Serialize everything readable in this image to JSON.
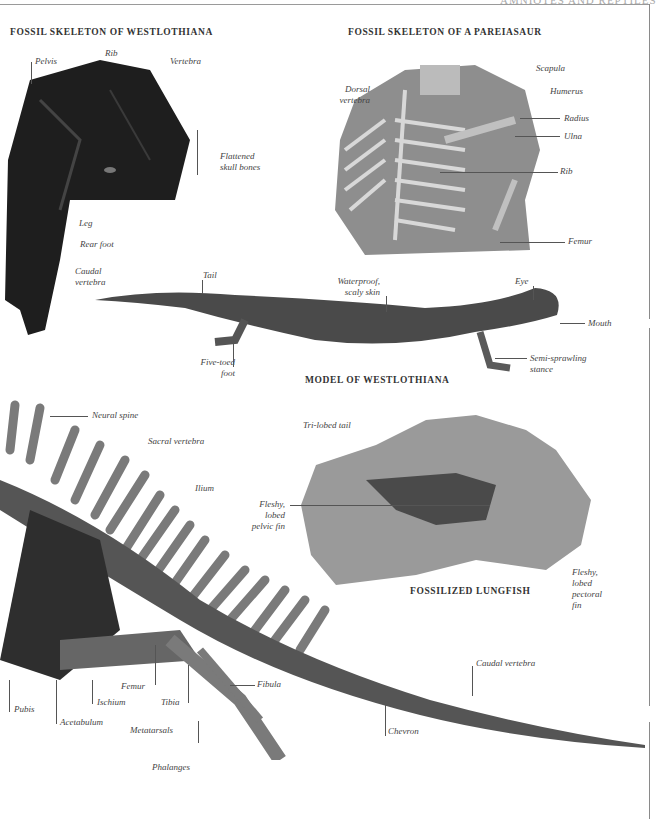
{
  "page": {
    "running_head": "AMNIOTES AND REPTILES"
  },
  "sections": {
    "westlothiana_fossil": {
      "title": "FOSSIL SKELETON OF WESTLOTHIANA",
      "labels": [
        "Pelvis",
        "Rib",
        "Vertebra",
        "Flattened",
        "skull bones",
        "Leg",
        "Rear foot",
        "Caudal",
        "vertebra"
      ]
    },
    "pareiasaur_fossil": {
      "title": "FOSSIL SKELETON OF A PAREIASAUR",
      "labels": [
        "Dorsal",
        "vertebra",
        "Scapula",
        "Humerus",
        "Radius",
        "Ulna",
        "Rib",
        "Femur"
      ]
    },
    "westlothiana_model": {
      "title": "MODEL OF WESTLOTHIANA",
      "labels": [
        "Tail",
        "Waterproof,",
        "scaly skin",
        "Eye",
        "Mouth",
        "Five-toed",
        "foot",
        "Semi-sprawling",
        "stance"
      ]
    },
    "lungfish": {
      "title": "FOSSILIZED LUNGFISH",
      "labels": [
        "Tri-lobed tail",
        "Fleshy,",
        "lobed",
        "pelvic fin",
        "Fleshy,",
        "lobed",
        "pectoral",
        "fin"
      ]
    },
    "skeleton": {
      "labels": [
        "Neural spine",
        "Sacral vertebra",
        "Ilium",
        "Pubis",
        "Acetabulum",
        "Ischium",
        "Femur",
        "Tibia",
        "Fibula",
        "Metatarsals",
        "Phalanges",
        "Caudal vertebra",
        "Chevron"
      ]
    }
  },
  "colors": {
    "rule": "#8a8a8a",
    "dark_fossil": "#222222",
    "stone": "#8f8f8f",
    "bone": "#7a7a7a"
  }
}
